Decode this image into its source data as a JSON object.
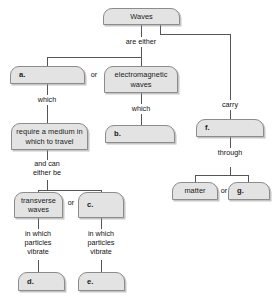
{
  "diagram": {
    "title": "Waves",
    "type": "concept-map",
    "nodes": [
      {
        "id": "waves",
        "label": "Waves"
      },
      {
        "id": "a",
        "label": "a."
      },
      {
        "id": "em",
        "label": "electromagnetic waves"
      },
      {
        "id": "medium",
        "label": "require a medium in which to travel"
      },
      {
        "id": "b",
        "label": "b."
      },
      {
        "id": "f",
        "label": "f."
      },
      {
        "id": "transverse",
        "label": "transverse waves"
      },
      {
        "id": "c",
        "label": "c."
      },
      {
        "id": "matter",
        "label": "matter"
      },
      {
        "id": "g",
        "label": "g."
      },
      {
        "id": "d",
        "label": "d."
      },
      {
        "id": "e",
        "label": "e."
      }
    ],
    "connectors": [
      {
        "id": "are-either",
        "label": "are either"
      },
      {
        "id": "which-left",
        "label": "which"
      },
      {
        "id": "which-mid",
        "label": "which"
      },
      {
        "id": "carry",
        "label": "carry"
      },
      {
        "id": "and-can",
        "label": "and can\neither be"
      },
      {
        "id": "through",
        "label": "through"
      },
      {
        "id": "vibrate-left",
        "label": "in which\nparticles\nvibrate"
      },
      {
        "id": "vibrate-right",
        "label": "in which\nparticles\nvibrate"
      }
    ],
    "or_labels": [
      {
        "id": "or-top",
        "label": "or"
      },
      {
        "id": "or-middle",
        "label": "or"
      },
      {
        "id": "or-right",
        "label": "or"
      }
    ],
    "colors": {
      "node_fill": "#e3e3e3",
      "node_border": "#8c8c8c",
      "line": "#555555",
      "text": "#1a1a1a",
      "background": "#ffffff"
    }
  }
}
